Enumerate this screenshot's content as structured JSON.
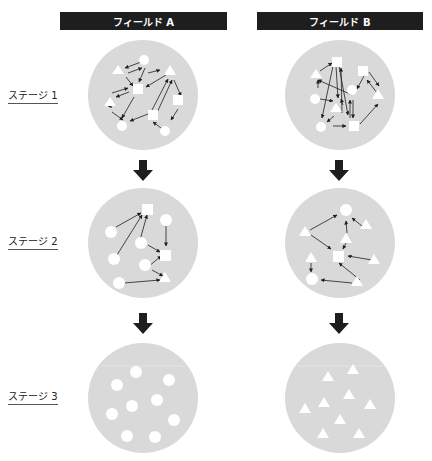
{
  "headers": {
    "a": "フィールド A",
    "b": "フィールド B"
  },
  "stages": [
    "ステージ 1",
    "ステージ 2",
    "ステージ 3"
  ],
  "colors": {
    "header_bg": "#1e1e1e",
    "circle": "#d9d9d9",
    "arrow": "#1e1e1e",
    "shape": "#ffffff"
  }
}
